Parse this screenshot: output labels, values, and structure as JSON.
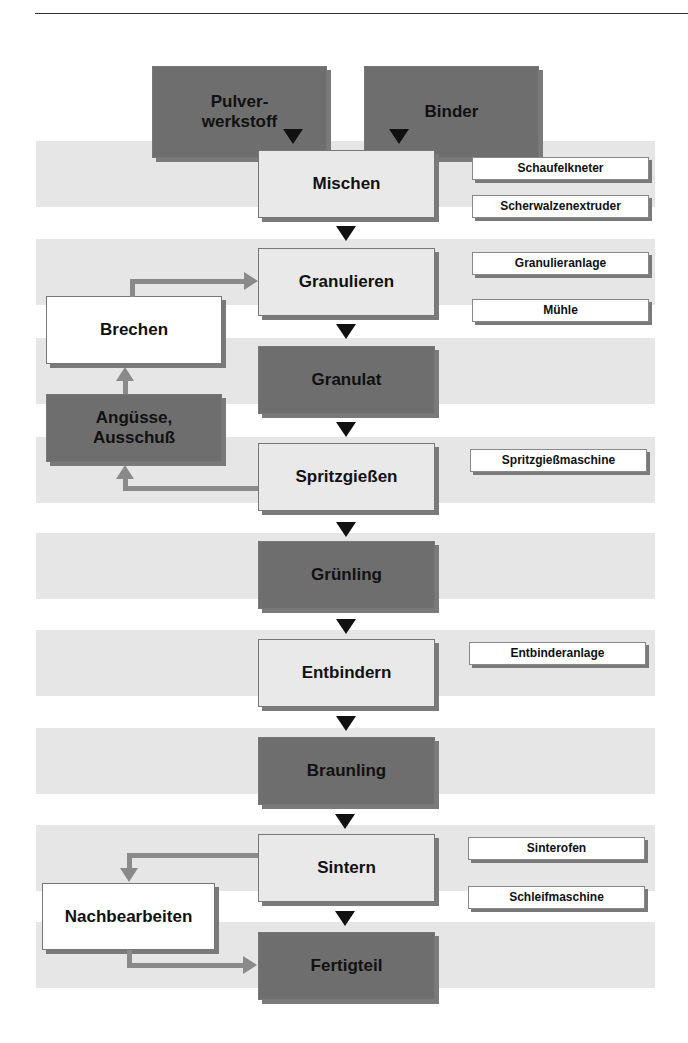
{
  "inputs": {
    "powder": "Pulver-\nwerkstoff",
    "binder": "Binder"
  },
  "steps": {
    "mixing": "Mischen",
    "granulating": "Granulieren",
    "granulate": "Granulat",
    "injection": "Spritzgießen",
    "green_part": "Grünling",
    "debinding": "Entbindern",
    "brown_part": "Braunling",
    "sintering": "Sintern",
    "finished_part": "Fertigteil"
  },
  "loops": {
    "crushing": "Brechen",
    "sprues": "Angüsse,\nAusschuß",
    "post_processing": "Nachbearbeiten"
  },
  "equipment": {
    "mixing": [
      "Schaufelkneter",
      "Scherwalzenextruder"
    ],
    "granulating": [
      "Granulieranlage",
      "Mühle"
    ],
    "injection": [
      "Spritzgießmaschine"
    ],
    "debinding": [
      "Entbinderanlage"
    ],
    "sintering": [
      "Sinterofen",
      "Schleifmaschine"
    ]
  },
  "colors": {
    "dark_box": "#6e6e6e",
    "light_box": "#e9e9e9",
    "band": "#e6e6e6",
    "arrow_black": "#111111",
    "arrow_gray": "#8a8a8a"
  }
}
